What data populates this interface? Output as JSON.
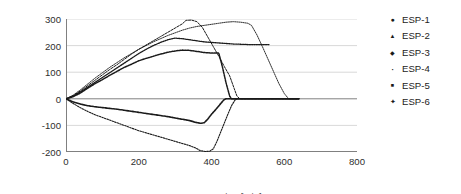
{
  "chart_data": {
    "type": "line",
    "title": "",
    "xlabel": "Measurement time[min]",
    "ylabel": "Difference of remaining battery[mAh]",
    "xlim": [
      0,
      800
    ],
    "ylim": [
      -200,
      300
    ],
    "xticks": [
      0,
      200,
      400,
      600,
      800
    ],
    "yticks": [
      -200,
      -100,
      0,
      100,
      200,
      300
    ],
    "grid": "horizontal",
    "legend_position": "right",
    "series": [
      {
        "name": "ESP-1",
        "marker": "circle",
        "points": [
          [
            0,
            0
          ],
          [
            20,
            8
          ],
          [
            40,
            22
          ],
          [
            60,
            40
          ],
          [
            80,
            57
          ],
          [
            100,
            72
          ],
          [
            120,
            88
          ],
          [
            140,
            103
          ],
          [
            160,
            118
          ],
          [
            180,
            130
          ],
          [
            200,
            143
          ],
          [
            220,
            152
          ],
          [
            240,
            160
          ],
          [
            260,
            168
          ],
          [
            280,
            175
          ],
          [
            300,
            180
          ],
          [
            320,
            183
          ],
          [
            340,
            182
          ],
          [
            360,
            178
          ],
          [
            380,
            174
          ],
          [
            400,
            172
          ],
          [
            420,
            172
          ],
          [
            430,
            120
          ],
          [
            440,
            60
          ],
          [
            450,
            10
          ],
          [
            455,
            0
          ],
          [
            470,
            0
          ],
          [
            500,
            0
          ],
          [
            560,
            0
          ],
          [
            620,
            0
          ],
          [
            640,
            0
          ]
        ]
      },
      {
        "name": "ESP-2",
        "marker": "triangle",
        "points": [
          [
            0,
            0
          ],
          [
            20,
            12
          ],
          [
            40,
            30
          ],
          [
            60,
            50
          ],
          [
            80,
            70
          ],
          [
            100,
            90
          ],
          [
            120,
            110
          ],
          [
            140,
            128
          ],
          [
            160,
            148
          ],
          [
            180,
            168
          ],
          [
            200,
            186
          ],
          [
            220,
            202
          ],
          [
            240,
            218
          ],
          [
            260,
            234
          ],
          [
            280,
            250
          ],
          [
            300,
            266
          ],
          [
            320,
            282
          ],
          [
            330,
            295
          ],
          [
            345,
            296
          ],
          [
            360,
            290
          ],
          [
            375,
            268
          ],
          [
            390,
            232
          ],
          [
            405,
            196
          ],
          [
            420,
            160
          ],
          [
            435,
            122
          ],
          [
            450,
            86
          ],
          [
            462,
            40
          ],
          [
            470,
            10
          ],
          [
            478,
            0
          ],
          [
            500,
            0
          ],
          [
            560,
            0
          ],
          [
            620,
            0
          ],
          [
            640,
            0
          ]
        ]
      },
      {
        "name": "ESP-3",
        "marker": "diamond",
        "points": [
          [
            0,
            0
          ],
          [
            20,
            10
          ],
          [
            40,
            26
          ],
          [
            60,
            44
          ],
          [
            80,
            62
          ],
          [
            100,
            80
          ],
          [
            120,
            98
          ],
          [
            140,
            116
          ],
          [
            160,
            134
          ],
          [
            180,
            152
          ],
          [
            200,
            170
          ],
          [
            220,
            186
          ],
          [
            240,
            200
          ],
          [
            260,
            212
          ],
          [
            280,
            222
          ],
          [
            300,
            228
          ],
          [
            320,
            226
          ],
          [
            340,
            222
          ],
          [
            360,
            218
          ],
          [
            380,
            214
          ],
          [
            400,
            212
          ],
          [
            420,
            210
          ],
          [
            440,
            208
          ],
          [
            460,
            206
          ],
          [
            480,
            205
          ],
          [
            500,
            204
          ],
          [
            520,
            204
          ],
          [
            540,
            204
          ],
          [
            560,
            204
          ]
        ]
      },
      {
        "name": "ESP-4",
        "marker": "dot",
        "points": [
          [
            0,
            0
          ],
          [
            20,
            14
          ],
          [
            40,
            34
          ],
          [
            60,
            56
          ],
          [
            80,
            78
          ],
          [
            100,
            98
          ],
          [
            120,
            118
          ],
          [
            140,
            136
          ],
          [
            160,
            154
          ],
          [
            180,
            170
          ],
          [
            200,
            186
          ],
          [
            220,
            200
          ],
          [
            240,
            214
          ],
          [
            260,
            226
          ],
          [
            280,
            238
          ],
          [
            300,
            248
          ],
          [
            320,
            258
          ],
          [
            340,
            266
          ],
          [
            360,
            272
          ],
          [
            380,
            276
          ],
          [
            400,
            280
          ],
          [
            420,
            284
          ],
          [
            440,
            288
          ],
          [
            460,
            290
          ],
          [
            480,
            288
          ],
          [
            500,
            284
          ],
          [
            510,
            276
          ],
          [
            525,
            240
          ],
          [
            540,
            196
          ],
          [
            555,
            150
          ],
          [
            570,
            104
          ],
          [
            585,
            58
          ],
          [
            600,
            20
          ],
          [
            612,
            0
          ],
          [
            625,
            0
          ],
          [
            640,
            0
          ]
        ]
      },
      {
        "name": "ESP-5",
        "marker": "square",
        "points": [
          [
            0,
            0
          ],
          [
            20,
            -12
          ],
          [
            40,
            -20
          ],
          [
            60,
            -26
          ],
          [
            80,
            -30
          ],
          [
            100,
            -33
          ],
          [
            120,
            -36
          ],
          [
            140,
            -39
          ],
          [
            160,
            -43
          ],
          [
            180,
            -47
          ],
          [
            200,
            -51
          ],
          [
            220,
            -55
          ],
          [
            240,
            -59
          ],
          [
            260,
            -63
          ],
          [
            280,
            -67
          ],
          [
            300,
            -72
          ],
          [
            320,
            -77
          ],
          [
            340,
            -82
          ],
          [
            355,
            -88
          ],
          [
            370,
            -92
          ],
          [
            380,
            -90
          ],
          [
            390,
            -76
          ],
          [
            400,
            -58
          ],
          [
            412,
            -40
          ],
          [
            424,
            -20
          ],
          [
            434,
            -4
          ],
          [
            440,
            0
          ],
          [
            460,
            0
          ],
          [
            500,
            0
          ],
          [
            560,
            0
          ],
          [
            620,
            0
          ],
          [
            640,
            0
          ]
        ]
      },
      {
        "name": "ESP-6",
        "marker": "star",
        "points": [
          [
            0,
            0
          ],
          [
            20,
            -18
          ],
          [
            40,
            -34
          ],
          [
            60,
            -48
          ],
          [
            80,
            -60
          ],
          [
            100,
            -70
          ],
          [
            120,
            -80
          ],
          [
            140,
            -90
          ],
          [
            160,
            -100
          ],
          [
            180,
            -110
          ],
          [
            200,
            -120
          ],
          [
            220,
            -128
          ],
          [
            240,
            -136
          ],
          [
            260,
            -144
          ],
          [
            280,
            -152
          ],
          [
            300,
            -160
          ],
          [
            320,
            -168
          ],
          [
            340,
            -176
          ],
          [
            355,
            -184
          ],
          [
            368,
            -194
          ],
          [
            382,
            -198
          ],
          [
            395,
            -197
          ],
          [
            405,
            -188
          ],
          [
            415,
            -160
          ],
          [
            425,
            -126
          ],
          [
            435,
            -92
          ],
          [
            445,
            -58
          ],
          [
            455,
            -26
          ],
          [
            465,
            -4
          ],
          [
            470,
            0
          ],
          [
            500,
            0
          ],
          [
            560,
            0
          ],
          [
            620,
            0
          ],
          [
            640,
            0
          ]
        ]
      }
    ]
  },
  "legend": {
    "items": [
      {
        "label": "ESP-1",
        "marker": "circle"
      },
      {
        "label": "ESP-2",
        "marker": "triangle"
      },
      {
        "label": "ESP-3",
        "marker": "diamond"
      },
      {
        "label": "ESP-4",
        "marker": "dot"
      },
      {
        "label": "ESP-5",
        "marker": "square"
      },
      {
        "label": "ESP-6",
        "marker": "star"
      }
    ]
  },
  "colors": {
    "line": "#1a1a1a",
    "grid": "#c8c8c8",
    "axis": "#808080",
    "text": "#2e2e2e"
  }
}
